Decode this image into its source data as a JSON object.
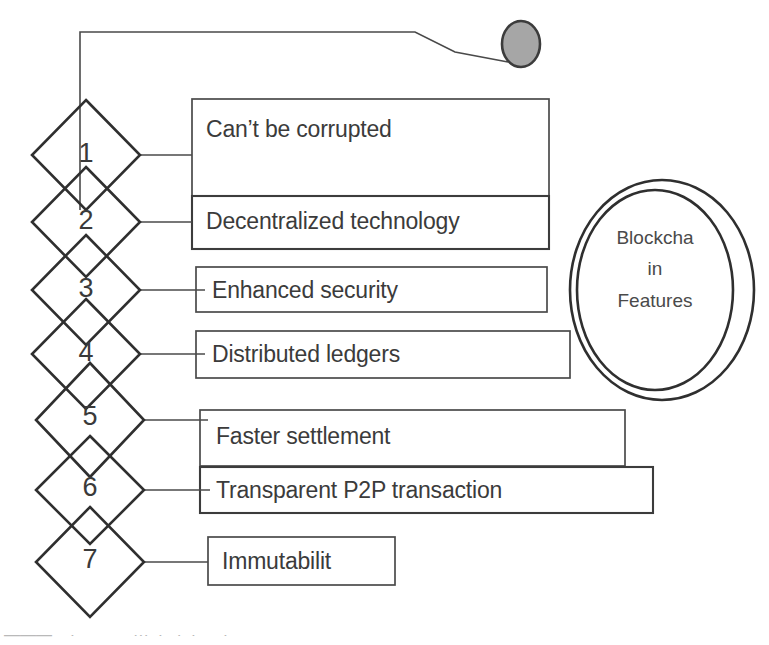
{
  "diagram": {
    "type": "numbered-diamond-list",
    "stroke_color": "#3c3c3c",
    "text_color": "#3b3b3b",
    "background_color": "#ffffff",
    "accent_fill": "#a6a6a6"
  },
  "center_node": {
    "name": "blockchain-features-ellipse",
    "line1": "Blockcha",
    "line2": "in",
    "line3": "Features",
    "full_text": "Blockchain Features"
  },
  "top_marker": {
    "name": "gray-dot-marker",
    "fill": "#a6a6a6",
    "stroke": "#3c3c3c"
  },
  "items": [
    {
      "number": "1",
      "label": "Can’t be corrupted"
    },
    {
      "number": "2",
      "label": "Decentralized technology"
    },
    {
      "number": "3",
      "label": "Enhanced security"
    },
    {
      "number": "4",
      "label": "Distributed ledgers"
    },
    {
      "number": "5",
      "label": "Faster settlement"
    },
    {
      "number": "6",
      "label": "Transparent P2P transaction"
    },
    {
      "number": "7",
      "label": "Immutabilit"
    }
  ]
}
